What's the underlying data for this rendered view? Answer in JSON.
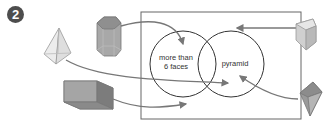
{
  "badge": {
    "number": "2"
  },
  "venn": {
    "circles": [
      {
        "label_line1": "more than",
        "label_line2": "6 faces"
      },
      {
        "label": "pyramid"
      }
    ]
  },
  "shapes": [
    {
      "name": "square-pyramid",
      "target": "outside-box"
    },
    {
      "name": "hexagonal-prism",
      "target": "more-than-6-faces"
    },
    {
      "name": "rectangular-prism",
      "target": "box-outside-circles"
    },
    {
      "name": "triangular-prism",
      "target": "box-outside-circles"
    },
    {
      "name": "triangular-pyramid",
      "target": "pyramid"
    }
  ],
  "colors": {
    "line": "#555555",
    "arrow": "#777777",
    "shape_light": "#dcdcdc",
    "shape_mid": "#a9a9a9",
    "shape_dark": "#7a7a7a",
    "badge": "#4d4d4d"
  }
}
